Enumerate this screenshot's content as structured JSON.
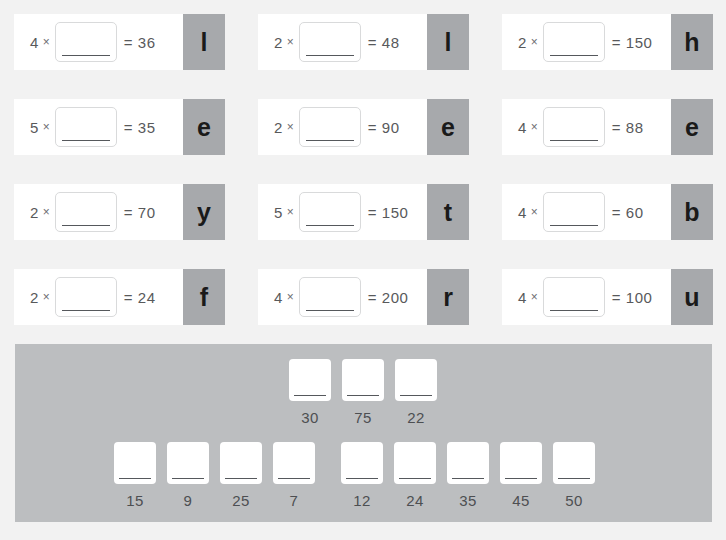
{
  "colors": {
    "page_background": "#f2f2f2",
    "card_background": "#ffffff",
    "letter_tile": "#a7a9ac",
    "bank_panel": "#bcbec0",
    "text": "#58595b",
    "underline": "#55585c"
  },
  "equations": [
    {
      "factor": "4",
      "times": "×",
      "equals": "= 36",
      "letter": "l"
    },
    {
      "factor": "2",
      "times": "×",
      "equals": "= 48",
      "letter": "l"
    },
    {
      "factor": "2",
      "times": "×",
      "equals": "= 150",
      "letter": "h"
    },
    {
      "factor": "5",
      "times": "×",
      "equals": "= 35",
      "letter": "e"
    },
    {
      "factor": "2",
      "times": "×",
      "equals": "= 90",
      "letter": "e"
    },
    {
      "factor": "4",
      "times": "×",
      "equals": "= 88",
      "letter": "e"
    },
    {
      "factor": "2",
      "times": "×",
      "equals": "= 70",
      "letter": "y"
    },
    {
      "factor": "5",
      "times": "×",
      "equals": "= 150",
      "letter": "t"
    },
    {
      "factor": "4",
      "times": "×",
      "equals": "= 60",
      "letter": "b"
    },
    {
      "factor": "2",
      "times": "×",
      "equals": "= 24",
      "letter": "f"
    },
    {
      "factor": "4",
      "times": "×",
      "equals": "= 200",
      "letter": "r"
    },
    {
      "factor": "4",
      "times": "×",
      "equals": "= 100",
      "letter": "u"
    }
  ],
  "answer_bank": {
    "top_row": [
      "30",
      "75",
      "22"
    ],
    "bottom_row_group_1": [
      "15",
      "9",
      "25",
      "7"
    ],
    "bottom_row_group_2": [
      "12",
      "24",
      "35",
      "45",
      "50"
    ]
  }
}
